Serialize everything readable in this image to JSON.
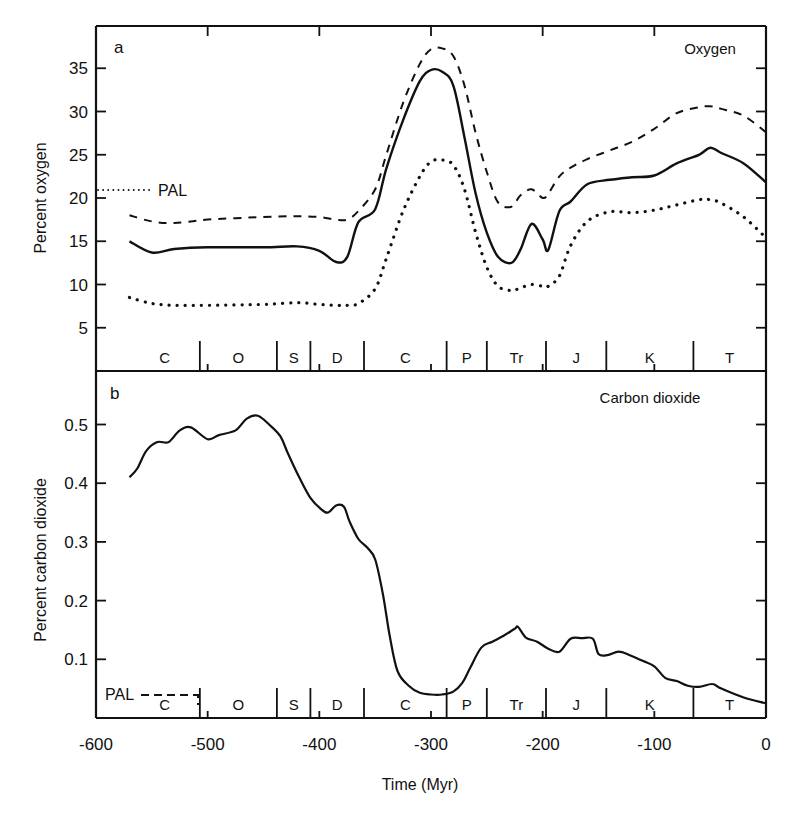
{
  "figure": {
    "x_axis": {
      "label": "Time (Myr)",
      "ticks": [
        "-600",
        "-500",
        "-400",
        "-300",
        "-200",
        "-100",
        "0"
      ],
      "tick_values": [
        -600,
        -500,
        -400,
        -300,
        -200,
        -100,
        0
      ]
    },
    "periods": [
      {
        "label": "C",
        "start": -570,
        "end": -507
      },
      {
        "label": "O",
        "start": -507,
        "end": -438
      },
      {
        "label": "S",
        "start": -438,
        "end": -408
      },
      {
        "label": "D",
        "start": -408,
        "end": -360
      },
      {
        "label": "C",
        "start": -360,
        "end": -286
      },
      {
        "label": "P",
        "start": -286,
        "end": -250
      },
      {
        "label": "Tr",
        "start": -250,
        "end": -197
      },
      {
        "label": "J",
        "start": -197,
        "end": -143
      },
      {
        "label": "K",
        "start": -143,
        "end": -65
      },
      {
        "label": "T",
        "start": -65,
        "end": 0
      }
    ],
    "panel_a": {
      "panel_label": "a",
      "title": "Oxygen",
      "ylabel": "Percent oxygen",
      "yticks": [
        "5",
        "10",
        "15",
        "20",
        "25",
        "30",
        "35"
      ],
      "pal_label": "PAL"
    },
    "panel_b": {
      "panel_label": "b",
      "title": "Carbon dioxide",
      "ylabel": "Percent carbon dioxide",
      "yticks": [
        "0.1",
        "0.2",
        "0.3",
        "0.4",
        "0.5"
      ],
      "pal_label": "PAL"
    }
  },
  "chart_data": [
    {
      "type": "line",
      "title": "Oxygen",
      "panel": "a",
      "xlabel": "Time (Myr)",
      "ylabel": "Percent oxygen",
      "xlim": [
        -600,
        0
      ],
      "ylim": [
        0,
        38
      ],
      "grid": false,
      "legend": "none (line styles: solid = best estimate, dashed = upper bound, dotted = lower bound)",
      "annotations": [
        {
          "text": "PAL",
          "y": 21,
          "style": "dotted reference line from x=-600 to about -570"
        }
      ],
      "x": [
        -570,
        -550,
        -530,
        -500,
        -450,
        -420,
        -400,
        -385,
        -375,
        -365,
        -350,
        -340,
        -325,
        -310,
        -300,
        -290,
        -280,
        -270,
        -260,
        -250,
        -240,
        -228,
        -220,
        -210,
        -200,
        -195,
        -185,
        -175,
        -160,
        -140,
        -120,
        -100,
        -80,
        -60,
        -50,
        -40,
        -20,
        0
      ],
      "series": [
        {
          "name": "Best estimate (solid)",
          "values": [
            15.0,
            13.7,
            14.1,
            14.3,
            14.3,
            14.4,
            13.9,
            12.6,
            13.2,
            17.2,
            18.7,
            23.4,
            29.0,
            33.5,
            34.8,
            34.6,
            33.0,
            27.0,
            20.5,
            16.0,
            13.2,
            12.5,
            14.0,
            17.0,
            15.2,
            14.0,
            18.5,
            19.6,
            21.6,
            22.1,
            22.4,
            22.6,
            24.0,
            25.0,
            25.8,
            25.2,
            24.0,
            21.8
          ]
        },
        {
          "name": "Upper bound (dashed)",
          "values": [
            18.0,
            17.3,
            17.1,
            17.5,
            17.8,
            17.9,
            17.8,
            17.5,
            17.5,
            18.5,
            21.0,
            25.0,
            31.0,
            35.5,
            37.2,
            37.3,
            36.4,
            33.0,
            27.5,
            23.0,
            19.5,
            19.0,
            20.3,
            21.0,
            20.0,
            20.5,
            22.5,
            23.5,
            24.5,
            25.5,
            26.5,
            28.0,
            29.8,
            30.5,
            30.6,
            30.3,
            29.5,
            27.6
          ]
        },
        {
          "name": "Lower bound (dotted)",
          "values": [
            8.5,
            7.8,
            7.6,
            7.6,
            7.7,
            7.9,
            7.7,
            7.6,
            7.6,
            7.8,
            9.5,
            13.0,
            18.5,
            22.5,
            24.2,
            24.4,
            23.8,
            21.0,
            16.0,
            12.0,
            9.8,
            9.3,
            9.6,
            10.0,
            9.8,
            9.8,
            11.0,
            14.5,
            17.3,
            18.4,
            18.3,
            18.6,
            19.2,
            19.8,
            19.8,
            19.4,
            17.8,
            15.4
          ]
        }
      ]
    },
    {
      "type": "line",
      "title": "Carbon dioxide",
      "panel": "b",
      "xlabel": "Time (Myr)",
      "ylabel": "Percent carbon dioxide",
      "xlim": [
        -600,
        0
      ],
      "ylim": [
        0,
        0.56
      ],
      "grid": false,
      "annotations": [
        {
          "text": "PAL",
          "y": 0.04,
          "style": "dashed reference line from about x=-580 to -500"
        }
      ],
      "x": [
        -570,
        -563,
        -555,
        -545,
        -535,
        -525,
        -515,
        -500,
        -490,
        -475,
        -465,
        -455,
        -445,
        -435,
        -428,
        -418,
        -408,
        -398,
        -392,
        -385,
        -378,
        -373,
        -365,
        -357,
        -350,
        -343,
        -337,
        -330,
        -320,
        -310,
        -300,
        -290,
        -280,
        -272,
        -265,
        -255,
        -245,
        -235,
        -225,
        -222,
        -215,
        -205,
        -195,
        -185,
        -175,
        -165,
        -155,
        -150,
        -142,
        -132,
        -122,
        -110,
        -100,
        -90,
        -80,
        -70,
        -60,
        -48,
        -40,
        -20,
        0
      ],
      "series": [
        {
          "name": "Carbon dioxide",
          "values": [
            0.41,
            0.425,
            0.455,
            0.47,
            0.47,
            0.49,
            0.495,
            0.475,
            0.482,
            0.49,
            0.51,
            0.515,
            0.5,
            0.48,
            0.45,
            0.41,
            0.375,
            0.355,
            0.35,
            0.362,
            0.36,
            0.335,
            0.305,
            0.29,
            0.27,
            0.21,
            0.14,
            0.08,
            0.055,
            0.043,
            0.04,
            0.04,
            0.045,
            0.06,
            0.085,
            0.12,
            0.13,
            0.14,
            0.152,
            0.155,
            0.137,
            0.13,
            0.118,
            0.113,
            0.135,
            0.136,
            0.135,
            0.109,
            0.107,
            0.113,
            0.107,
            0.097,
            0.088,
            0.068,
            0.063,
            0.055,
            0.053,
            0.058,
            0.05,
            0.035,
            0.025
          ]
        }
      ]
    }
  ]
}
